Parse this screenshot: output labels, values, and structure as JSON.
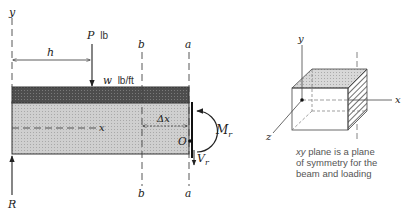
{
  "beam_diagram": {
    "labels": {
      "y_axis": "y",
      "x_axis": "x",
      "load_P": "P",
      "load_P_unit": "lb",
      "dist_h": "h",
      "load_w": "w",
      "load_w_unit": "lb/ft",
      "section_b_top": "b",
      "section_b_bottom": "b",
      "section_a_top": "a",
      "section_a_bottom": "a",
      "delta_x": "Δx",
      "moment": "M",
      "moment_sub": "r",
      "shear": "V",
      "shear_sub": "r",
      "point_O": "O",
      "reaction": "R"
    },
    "colors": {
      "load_band": "#4a4a4a",
      "beam_body": "#c8c8c8",
      "line": "#222222"
    }
  },
  "cube_diagram": {
    "labels": {
      "y_axis": "y",
      "x_axis": "x",
      "z_axis": "z"
    },
    "caption": {
      "line1_italic": "xy",
      "line1_rest": " plane is a plane",
      "line2": "of symmetry for the",
      "line3": "beam and loading"
    }
  }
}
